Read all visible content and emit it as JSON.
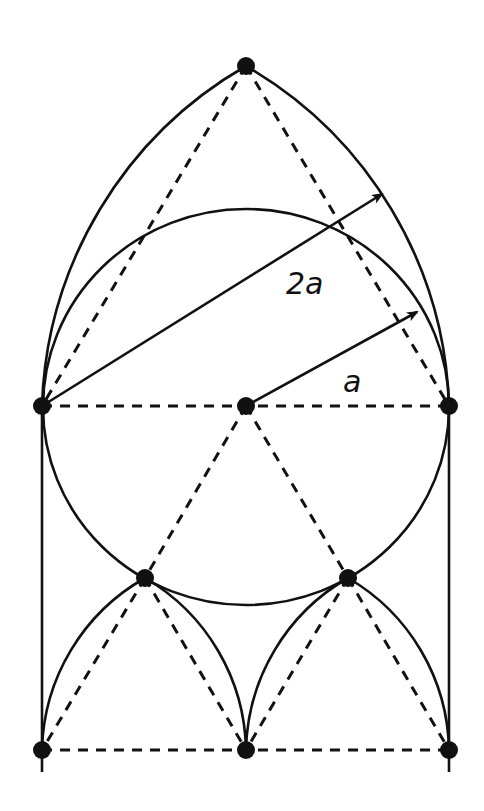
{
  "diagram": {
    "labels": {
      "outer_radius": "2a",
      "inner_radius": "a"
    },
    "colors": {
      "stroke": "#111111",
      "background": "#ffffff"
    },
    "points": [
      {
        "id": "apex",
        "x": 246,
        "y": 66
      },
      {
        "id": "left-mid",
        "x": 42,
        "y": 406
      },
      {
        "id": "center",
        "x": 246,
        "y": 406
      },
      {
        "id": "right-mid",
        "x": 449,
        "y": 406
      },
      {
        "id": "lower-left",
        "x": 145,
        "y": 578
      },
      {
        "id": "lower-right",
        "x": 348,
        "y": 578
      },
      {
        "id": "bottom-left",
        "x": 42,
        "y": 750
      },
      {
        "id": "bottom-center",
        "x": 246,
        "y": 750
      },
      {
        "id": "bottom-right",
        "x": 449,
        "y": 750
      }
    ]
  }
}
